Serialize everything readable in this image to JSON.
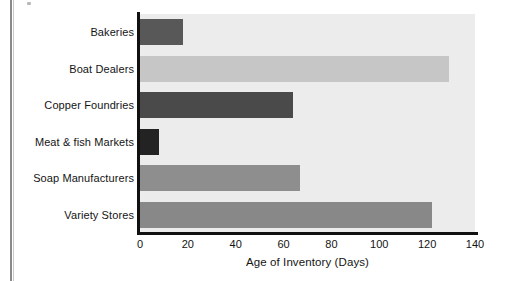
{
  "chart_data": {
    "type": "bar",
    "orientation": "horizontal",
    "title": "",
    "xlabel": "Age of Inventory (Days)",
    "ylabel": "",
    "categories": [
      "Bakeries",
      "Boat Dealers",
      "Copper Foundries",
      "Meat & fish Markets",
      "Soap Manufacturers",
      "Variety Stores"
    ],
    "values": [
      18,
      129,
      64,
      8,
      67,
      122
    ],
    "xlim": [
      0,
      140
    ],
    "xticks": [
      0,
      20,
      40,
      60,
      80,
      100,
      120,
      140
    ],
    "xtick_labels": [
      "0",
      "20",
      "40",
      "60",
      "80",
      "100",
      "120",
      "140"
    ],
    "grid": false,
    "legend": false,
    "bar_colors": [
      "#585858",
      "#c6c6c6",
      "#4a4a4a",
      "#232323",
      "#8e8e8e",
      "#888888"
    ],
    "plot_background": "#ececec",
    "axis_color": "#111111"
  },
  "figure": {
    "page_gutter_color": "#8a8a8a",
    "background": "#ffffff"
  }
}
